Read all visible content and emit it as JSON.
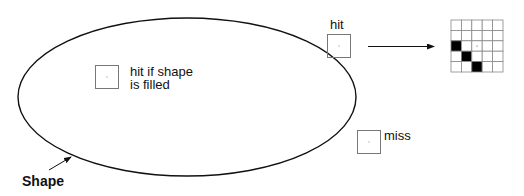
{
  "diagram": {
    "shape": {
      "label": "Shape",
      "ellipse": {
        "cx": 187,
        "cy": 97,
        "rx": 169,
        "ry": 79
      },
      "stroke": "#111111"
    },
    "probes": [
      {
        "id": "inside",
        "label_lines": [
          "hit if shape",
          "is filled"
        ],
        "x": 95,
        "y": 65,
        "size": 23
      },
      {
        "id": "edge",
        "label_lines": [
          "hit"
        ],
        "x": 327,
        "y": 34,
        "size": 23
      },
      {
        "id": "outside",
        "label_lines": [
          "miss"
        ],
        "x": 357,
        "y": 130,
        "size": 23
      }
    ],
    "pixel_grid": {
      "rows": 5,
      "cols": 5,
      "filled_cells": [
        [
          2,
          0
        ],
        [
          3,
          1
        ],
        [
          4,
          2
        ]
      ],
      "center_cell": [
        2,
        2
      ],
      "fill_color": "#000000",
      "line_color": "#888888"
    }
  }
}
